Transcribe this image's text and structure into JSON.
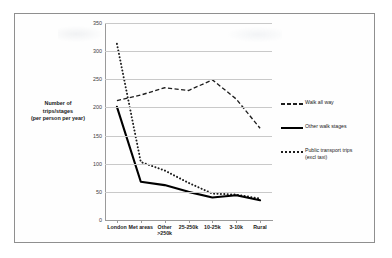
{
  "chart_data": {
    "type": "line",
    "title": "",
    "xlabel": "",
    "ylabel": "Number of trips/stages (per person per year)",
    "ylabel_lines": [
      "Number of",
      "trips/stages",
      "(per person per year)"
    ],
    "categories": [
      "London",
      "Met areas",
      "Other >250k",
      "25-250k",
      "10-25k",
      "3-10k",
      "Rural"
    ],
    "category_lines": [
      [
        "London"
      ],
      [
        "Met areas"
      ],
      [
        "Other",
        ">250k"
      ],
      [
        "25-250k"
      ],
      [
        "10-25k"
      ],
      [
        "3-10k"
      ],
      [
        "Rural"
      ]
    ],
    "ylim": [
      0,
      350
    ],
    "yticks": [
      0,
      50,
      100,
      150,
      200,
      250,
      300,
      350
    ],
    "ytick_labels": [
      "0",
      "50",
      "100",
      "150",
      "200",
      "250",
      "300",
      "350"
    ],
    "grid": true,
    "legend_position": "right",
    "series": [
      {
        "name": "Walk all way",
        "style": "dashed",
        "color": "#1d1d1d",
        "values": [
          212,
          222,
          235,
          230,
          249,
          215,
          163
        ]
      },
      {
        "name": "Other walk stages",
        "style": "solid",
        "color": "#000000",
        "values": [
          201,
          68,
          62,
          50,
          40,
          44,
          35
        ]
      },
      {
        "name": "Public transport trips (excl taxi)",
        "style": "dotted",
        "color": "#1d1d1d",
        "values": [
          313,
          103,
          88,
          66,
          47,
          45,
          38
        ]
      }
    ],
    "legend": [
      {
        "label": "Public transport trips",
        "label_lines": [
          "Walk all way"
        ],
        "key": "dashed-line-key"
      },
      {
        "label": "Other walk stages",
        "label_lines": [
          "Other walk stages"
        ],
        "key": "solid-line-key"
      },
      {
        "label": "Public transport trips (excl taxi)",
        "label_lines": [
          "Public transport trips",
          "(excl taxi)"
        ],
        "key": "dotted-line-key"
      }
    ]
  },
  "figure": {
    "background_color": "#ffffff",
    "frame_color": "#8f8f8f",
    "grid_color": "#c9c9c9",
    "axis_color": "#9a9a9a"
  }
}
